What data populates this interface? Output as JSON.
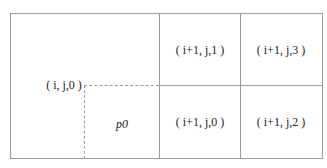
{
  "diagram": {
    "origin_label": "( i, j,0 )",
    "sub_region_label": "p0",
    "cells": [
      {
        "position": "top-left",
        "label": "( i+1, j,1 )"
      },
      {
        "position": "top-right",
        "label": "( i+1, j,3 )"
      },
      {
        "position": "bottom-left",
        "label": "( i+1, j,0 )"
      },
      {
        "position": "bottom-right",
        "label": "( i+1, j,2 )"
      }
    ]
  }
}
